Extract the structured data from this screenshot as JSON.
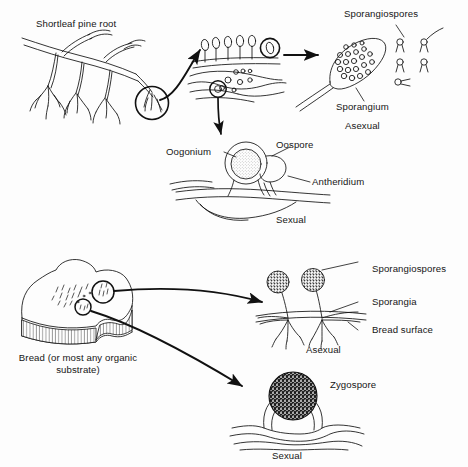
{
  "figure": {
    "background_color": "#fdfdfd",
    "ink_color": "#111111",
    "panels": [
      {
        "id": "panel-pine-root",
        "name": "Pythium / water mold on pine root",
        "substrate_label": "Shortleaf pine root",
        "asexual_label": "Asexual",
        "sexual_label": "Sexual",
        "callouts": [
          {
            "name": "sporangium-callout",
            "label": "Sporangium"
          },
          {
            "name": "sporangiospores-callout",
            "label": "Sporangiospores"
          },
          {
            "name": "oogonium-callout",
            "label": "Oogonium"
          },
          {
            "name": "oospore-callout",
            "label": "Oospore"
          },
          {
            "name": "antheridium-callout",
            "label": "Antheridium"
          }
        ]
      },
      {
        "id": "panel-bread-mold",
        "name": "Rhizopus bread mold",
        "substrate_label": "Bread (or most any organic substrate)",
        "asexual_label": "Asexual",
        "sexual_label": "Sexual",
        "callouts": [
          {
            "name": "sporangiospores-callout",
            "label": "Sporangiospores"
          },
          {
            "name": "sporangia-callout",
            "label": "Sporangia"
          },
          {
            "name": "bread-surface-callout",
            "label": "Bread surface"
          },
          {
            "name": "zygospore-callout",
            "label": "Zygospore"
          }
        ]
      }
    ]
  },
  "labels": {
    "shortleaf_pine_root": "Shortleaf pine root",
    "sporangiospores_top": "Sporangiospores",
    "sporangium": "Sporangium",
    "asexual_top": "Asexual",
    "oogonium": "Oogonium",
    "oospore": "Oospore",
    "antheridium": "Antheridium",
    "sexual_top": "Sexual",
    "bread_substrate": "Bread (or most any organic substrate)",
    "sporangiospores_bottom": "Sporangiospores",
    "sporangia": "Sporangia",
    "bread_surface": "Bread surface",
    "asexual_bottom": "Asexual",
    "zygospore": "Zygospore",
    "sexual_bottom": "Sexual"
  }
}
